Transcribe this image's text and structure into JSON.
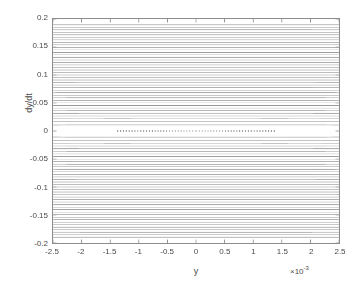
{
  "figure": {
    "background": "#ffffff",
    "axes_color": "#8c8c8c",
    "text_color": "#4a4a4a"
  },
  "axis": {
    "x_title": "y",
    "y_title": "dy/dt",
    "x_exponent_prefix": "×10",
    "x_exponent_power": "-3",
    "x_ticks": [
      "-2.5",
      "-2",
      "-1.5",
      "-1",
      "-0.5",
      "0",
      "0.5",
      "1",
      "1.5",
      "2",
      "2.5"
    ],
    "y_ticks": [
      "0.2",
      "0.15",
      "0.1",
      "0.05",
      "0",
      "-0.05",
      "-0.1",
      "-0.15",
      "-0.2"
    ]
  },
  "chart_data": {
    "type": "line",
    "title": "",
    "subtitle": "",
    "xlabel": "y",
    "ylabel": "dy/dt",
    "x_scale_exponent": -3,
    "xlim": [
      -2.5,
      2.5
    ],
    "ylim": [
      -0.2,
      0.2
    ],
    "xticks": [
      -2.5,
      -2,
      -1.5,
      -1,
      -0.5,
      0,
      0.5,
      1,
      1.5,
      2,
      2.5
    ],
    "yticks": [
      -0.2,
      -0.15,
      -0.1,
      -0.05,
      0,
      0.05,
      0.1,
      0.15,
      0.2
    ],
    "grid": false,
    "legend": null,
    "plot_kind": "phase-portrait-contours",
    "hamiltonian": "H = 0.5*v^2 - 0.5*a*y^2 + 0.25*b*y^4",
    "parameters": {
      "a": 1.0,
      "b": 510200.0,
      "v_unit": 1.0
    },
    "fixed_points": [
      {
        "name": "centre-left",
        "y": -0.0014,
        "dydt": 0.0,
        "type": "centre"
      },
      {
        "name": "saddle",
        "y": 0.0,
        "dydt": 0.0,
        "type": "saddle"
      },
      {
        "name": "centre-right",
        "y": 0.0014,
        "dydt": 0.0,
        "type": "centre"
      }
    ],
    "separatrix": {
      "style": "dotted",
      "energy": 0.0,
      "lobe_half_width": 0.00198,
      "lobe_peak_dydt": 0.099,
      "saddle_slope_dydt_per_y": 49.5
    },
    "contour_levels": [
      -0.00098,
      -0.00092,
      -0.00086,
      -0.0008,
      -0.00074,
      -0.00068,
      -0.00062,
      -0.00056,
      -0.0005,
      -0.00044,
      -0.00038,
      -0.00032,
      -0.00026,
      -0.0002,
      -0.00014,
      -8e-05,
      -2e-05,
      0.0,
      6e-05,
      0.00014,
      0.00024,
      0.00036,
      0.0005,
      0.00066,
      0.00084,
      0.00104,
      0.00126,
      0.0015,
      0.00176,
      0.00204,
      0.00234,
      0.00266,
      0.003,
      0.00336,
      0.00374,
      0.00414,
      0.00456,
      0.005,
      0.00546,
      0.00594,
      0.00644,
      0.00696,
      0.0075,
      0.00806,
      0.00864,
      0.00924,
      0.00986,
      0.0105,
      0.01116,
      0.01184,
      0.01254,
      0.01326,
      0.014,
      0.01476,
      0.01554,
      0.01634,
      0.01716,
      0.018
    ],
    "series": [
      {
        "name": "contour-lines",
        "color": "#9a9a9a",
        "style": "solid",
        "count": 58
      },
      {
        "name": "separatrix",
        "color": "#8f8f8f",
        "style": "dotted",
        "count": 1
      }
    ]
  }
}
